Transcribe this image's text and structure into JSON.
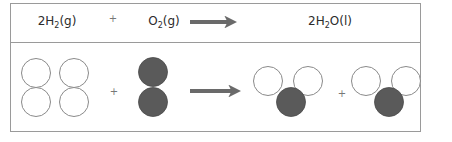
{
  "equation": {
    "reactant_1": {
      "coef": "2",
      "element": "H",
      "subscript": "2",
      "state": "(g)"
    },
    "operator": "+",
    "reactant_2": {
      "coef": "",
      "element": "O",
      "subscript": "2",
      "state": "(g)"
    },
    "arrow": "right-arrow",
    "product": {
      "coef": "2",
      "element": "H",
      "subscript": "2",
      "suffix": "O",
      "state": "(l)"
    }
  },
  "particles": {
    "operator_1": "+",
    "operator_2": "+",
    "hydrogen_color": "#ffffff",
    "hydrogen_stroke": "#8a8a8a",
    "oxygen_color": "#5a5a5a",
    "arrow_color": "#6a6a6a",
    "reactants": [
      {
        "name": "H2 molecule",
        "atoms": [
          "H",
          "H"
        ]
      },
      {
        "name": "H2 molecule",
        "atoms": [
          "H",
          "H"
        ]
      },
      {
        "name": "O2 molecule",
        "atoms": [
          "O",
          "O"
        ]
      }
    ],
    "products": [
      {
        "name": "H2O molecule",
        "atoms": [
          "H",
          "O",
          "H"
        ]
      },
      {
        "name": "H2O molecule",
        "atoms": [
          "H",
          "O",
          "H"
        ]
      }
    ]
  }
}
